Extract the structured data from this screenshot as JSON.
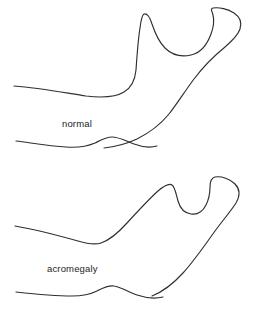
{
  "figure": {
    "background_color": "#ffffff",
    "stroke_color": "#2f2f2f",
    "text_color": "#1d1d1d",
    "width": 257,
    "height": 309
  },
  "panels": [
    {
      "id": "normal",
      "label": "normal",
      "label_x": 62,
      "label_y": 127,
      "description": "Lateral outline of a normal adult mandible with a pointed coronoid process, deep sigmoid notch and rounded condyle.",
      "paths": {
        "upper_border": "M 14 86 C 40 88 66 93 86 96 C 103 98 116 97 124 92 C 131 88 135 80 136 70 C 137 56 138 40 140 28 C 141 20 142 15 144 14 C 147 13 150 17 152 24 C 155 33 159 42 165 48 C 172 55 182 57 191 55 C 200 53 207 45 211 34 C 214 26 214 19 213 15 C 212 11 210 9 213 8 C 219 7 228 9 234 13 C 240 17 242 23 240 29 C 238 35 232 41 225 47 C 214 56 203 67 194 79 C 185 91 177 104 169 114 C 160 125 149 133 137 139 C 126 144 114 147 104 148",
        "lower_border": "M 16 141 C 32 143 50 146 66 147 C 78 148 88 146 95 143 C 101 140 106 137 112 137 C 119 137 126 141 134 144 C 142 147 150 148 157 146"
      }
    },
    {
      "id": "acromegaly",
      "label": "acromegaly",
      "label_x": 47,
      "label_y": 272,
      "description": "Lateral outline of an acromegalic mandible showing enlargement, elongation of the body and ramus, and an increased gonial angle (prognathism).",
      "paths": {
        "upper_border": "M 15 226 C 38 230 60 236 78 241 C 88 244 95 245 101 243 C 110 240 118 233 127 223 C 138 211 149 199 158 191 C 164 186 169 183 172 185 C 175 187 176 194 178 201 C 180 208 184 213 191 214 C 198 215 203 211 206 205 C 209 199 210 192 210 187 C 210 182 211 178 215 177 C 222 176 230 179 235 184 C 240 189 240 196 236 203 C 231 211 223 220 215 231 C 205 245 194 261 183 273 C 173 284 162 292 152 296",
        "lower_border": "M 16 292 C 34 294 54 296 72 296 C 83 296 91 294 97 291 C 103 288 108 285 114 286 C 121 287 128 292 137 295 C 146 298 155 299 163 297"
      }
    }
  ]
}
